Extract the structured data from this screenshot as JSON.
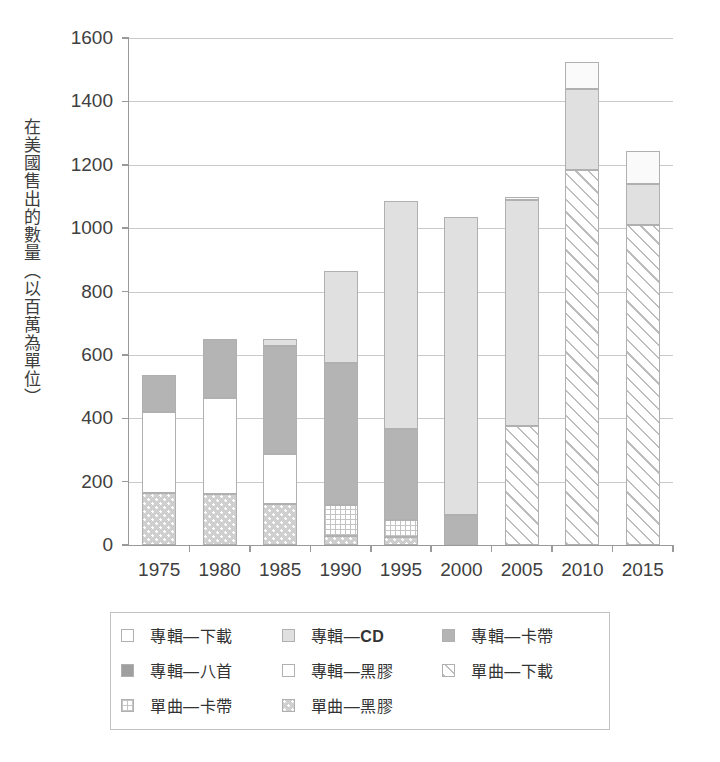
{
  "chart_data": {
    "type": "bar",
    "subtype": "stacked-bar",
    "title": "",
    "xlabel": "",
    "ylabel": "在美國售出的數量（以百萬為單位）",
    "categories": [
      "1975",
      "1980",
      "1985",
      "1990",
      "1995",
      "2000",
      "2005",
      "2010",
      "2015"
    ],
    "ylim": [
      0,
      1600
    ],
    "yticks": [
      0,
      200,
      400,
      600,
      800,
      1000,
      1200,
      1400,
      1600
    ],
    "ytick_labels": [
      "0",
      "200",
      "400",
      "600",
      "800",
      "1000",
      "1200",
      "1400",
      "1600"
    ],
    "grid": true,
    "legend_position": "bottom",
    "stack_order_bottom_to_top": [
      "單曲—黑膠",
      "單曲—卡帶",
      "單曲—下載",
      "專輯—黑膠",
      "專輯—八首",
      "專輯—卡帶",
      "專輯—CD",
      "專輯—下載"
    ],
    "series": [
      {
        "name": "單曲—黑膠",
        "key": "single_vinyl",
        "fill": "dotted",
        "color": "#cfcfcf",
        "values": [
          165,
          160,
          128,
          30,
          25,
          0,
          0,
          0,
          0
        ]
      },
      {
        "name": "單曲—卡帶",
        "key": "single_cassette",
        "fill": "grid",
        "color": "#ffffff",
        "values": [
          0,
          0,
          0,
          95,
          55,
          0,
          0,
          0,
          0
        ]
      },
      {
        "name": "單曲—下載",
        "key": "single_download",
        "fill": "diagonal",
        "color": "#ffffff",
        "values": [
          0,
          0,
          0,
          0,
          0,
          0,
          375,
          1185,
          1010
        ]
      },
      {
        "name": "專輯—黑膠",
        "key": "album_vinyl",
        "fill": "solid",
        "color": "#ffffff",
        "values": [
          255,
          305,
          160,
          0,
          0,
          0,
          0,
          0,
          0
        ]
      },
      {
        "name": "專輯—八首",
        "key": "album_8track",
        "fill": "solid",
        "color": "#9f9f9f",
        "values": [
          0,
          0,
          0,
          0,
          0,
          0,
          0,
          0,
          0
        ]
      },
      {
        "name": "專輯—卡帶",
        "key": "album_cassette",
        "fill": "solid",
        "color": "#b4b4b4",
        "values": [
          115,
          185,
          340,
          450,
          285,
          95,
          0,
          0,
          0
        ]
      },
      {
        "name": "專輯—CD",
        "key": "album_cd",
        "fill": "solid",
        "color": "#e0e0e0",
        "values": [
          0,
          0,
          22,
          290,
          720,
          940,
          715,
          255,
          130
        ]
      },
      {
        "name": "專輯—下載",
        "key": "album_download",
        "fill": "solid",
        "color": "#fafafa",
        "values": [
          0,
          0,
          0,
          0,
          0,
          0,
          8,
          85,
          105
        ]
      }
    ],
    "totals": [
      535,
      650,
      650,
      865,
      1085,
      1035,
      1098,
      1525,
      1245
    ]
  },
  "legend": {
    "entries": [
      {
        "label": "專輯—下載",
        "fill": "solid-white"
      },
      {
        "label": "專輯—CD",
        "fill": "solid-cd"
      },
      {
        "label": "專輯—卡帶",
        "fill": "solid-cassette"
      },
      {
        "label": "專輯—八首",
        "fill": "solid-8track"
      },
      {
        "label": "專輯—黑膠",
        "fill": "solid-white"
      },
      {
        "label": "單曲—下載",
        "fill": "diagonal"
      },
      {
        "label": "單曲—卡帶",
        "fill": "grid"
      },
      {
        "label": "單曲—黑膠",
        "fill": "dotted"
      }
    ]
  }
}
